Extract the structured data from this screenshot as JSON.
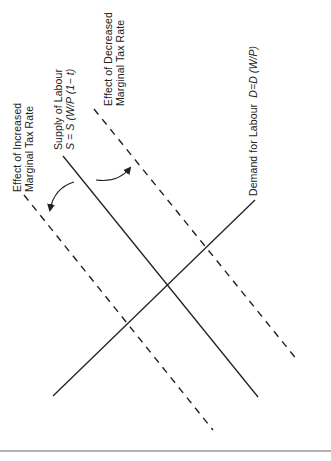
{
  "diagram": {
    "labels": {
      "increased": {
        "line1": "Effect of Increased",
        "line2": "Marginal Tax Rate"
      },
      "supply": {
        "line1": "Supply of Labour",
        "line2": "S = S (W/P (1− t)"
      },
      "decreased": {
        "line1": "Effect of Decreased",
        "line2": "Marginal Tax Rate"
      },
      "demand": {
        "name": "Demand for Labour",
        "formula": "D=D (W/P)"
      }
    },
    "lines": [
      {
        "id": "demand",
        "style": "solid",
        "from": [
          53,
          396
        ],
        "to": [
          255,
          200
        ]
      },
      {
        "id": "supply",
        "style": "solid",
        "from": [
          63,
          156
        ],
        "to": [
          258,
          397
        ]
      },
      {
        "id": "supply-increased-tax",
        "style": "dashed",
        "from": [
          24,
          195
        ],
        "to": [
          213,
          430
        ]
      },
      {
        "id": "supply-decreased-tax",
        "style": "dashed",
        "from": [
          94,
          109
        ],
        "to": [
          298,
          361
        ]
      }
    ],
    "arrows": [
      {
        "id": "shift-left",
        "from": [
          74,
          182
        ],
        "to": [
          49,
          213
        ]
      },
      {
        "id": "shift-right",
        "from": [
          96,
          180
        ],
        "to": [
          131,
          166
        ]
      }
    ],
    "colors": {
      "ink": "#222222",
      "rule": "#666666",
      "background": "#ffffff"
    }
  }
}
